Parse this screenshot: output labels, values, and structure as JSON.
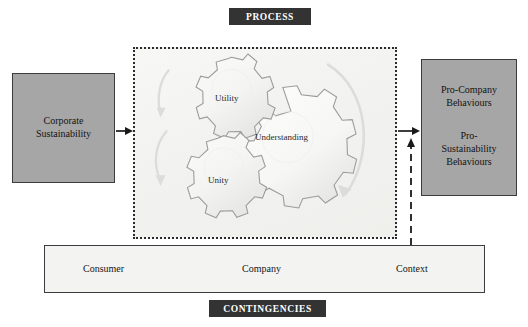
{
  "diagram": {
    "title_top_banner": "PROCESS",
    "title_bottom_banner": "CONTINGENCIES"
  },
  "input_box": {
    "line1": "Corporate",
    "line2": "Sustainability"
  },
  "output_box": {
    "pro_company_line1": "Pro-Company",
    "pro_company_line2": "Behaviours",
    "pro_sustainability_line1": "Pro-",
    "pro_sustainability_line2": "Sustainability",
    "pro_sustainability_line3": "Behaviours"
  },
  "process": {
    "gears": [
      {
        "name": "utility",
        "label": "Utility"
      },
      {
        "name": "understanding",
        "label": "Understanding"
      },
      {
        "name": "unity",
        "label": "Unity"
      }
    ]
  },
  "contingencies": {
    "items": [
      {
        "name": "consumer",
        "label": "Consumer"
      },
      {
        "name": "company",
        "label": "Company"
      },
      {
        "name": "context",
        "label": "Context"
      }
    ]
  },
  "colors": {
    "banner_background": "#333333",
    "banner_text": "#ffffff",
    "side_box_fill": "#a6a6a6",
    "side_box_border": "#3c3c3c",
    "process_area_fill": "#f4f4f2",
    "process_area_border": "#2b2b2b",
    "contingencies_fill": "#f3f3f1",
    "gear_outline": "#9a9a9a",
    "arrow_color": "#1a1a1a",
    "faint_arrow_color": "#d8d8d6"
  }
}
